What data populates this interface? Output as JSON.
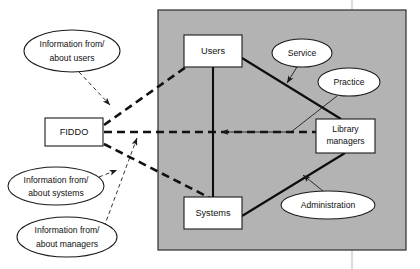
{
  "diagram": {
    "background_color": "#ffffff",
    "panel": {
      "label": "library-context-panel",
      "fill": "#b3b3b3",
      "stroke": "#3a3a3a",
      "x": 158,
      "y": 10,
      "width": 248,
      "height": 240
    },
    "boxes": [
      {
        "id": "fiddo",
        "label": "FIDDO",
        "lines": [
          "FIDDO"
        ],
        "x": 45,
        "y": 118,
        "width": 58,
        "height": 28
      },
      {
        "id": "users",
        "label": "Users",
        "lines": [
          "Users"
        ],
        "x": 184,
        "y": 35,
        "width": 58,
        "height": 32
      },
      {
        "id": "systems",
        "label": "Systems",
        "lines": [
          "Systems"
        ],
        "x": 184,
        "y": 197,
        "width": 58,
        "height": 32
      },
      {
        "id": "library-managers",
        "label": "Library managers",
        "lines": [
          "Library",
          "managers"
        ],
        "x": 316,
        "y": 119,
        "width": 59,
        "height": 34
      }
    ],
    "ellipses": [
      {
        "id": "information-from-about-users",
        "label": "Information from/ about users",
        "lines": [
          "Information from/",
          "about users"
        ],
        "cx": 72,
        "cy": 51,
        "rx": 48,
        "ry": 21
      },
      {
        "id": "information-from-about-systems",
        "label": "Information from/ about systems",
        "lines": [
          "Information from/",
          "about systems"
        ],
        "cx": 56,
        "cy": 186,
        "rx": 48,
        "ry": 19
      },
      {
        "id": "information-from-about-managers",
        "label": "Information from/ about managers",
        "lines": [
          "Information from/",
          "about managers"
        ],
        "cx": 67,
        "cy": 237,
        "rx": 50,
        "ry": 20
      },
      {
        "id": "service",
        "label": "Service",
        "lines": [
          "Service"
        ],
        "cx": 302,
        "cy": 53,
        "rx": 30,
        "ry": 14
      },
      {
        "id": "practice",
        "label": "Practice",
        "lines": [
          "Practice"
        ],
        "cx": 349,
        "cy": 82,
        "rx": 31,
        "ry": 14
      },
      {
        "id": "administration",
        "label": "Administration",
        "lines": [
          "Administration"
        ],
        "cx": 328,
        "cy": 205,
        "rx": 47,
        "ry": 14
      }
    ],
    "connections": [
      {
        "id": "fiddo-to-users",
        "style": "thick-dashed",
        "from": "fiddo",
        "to": "users"
      },
      {
        "id": "fiddo-to-library-managers",
        "style": "thick-dashed",
        "from": "fiddo",
        "to": "library-managers"
      },
      {
        "id": "fiddo-to-systems",
        "style": "thick-dashed",
        "from": "fiddo",
        "to": "systems"
      },
      {
        "id": "users-ellipse-to-fiddo-link",
        "style": "thin-dashed-arrow",
        "from": "information-from-about-users",
        "to": "fiddo-to-users"
      },
      {
        "id": "systems-ellipse-to-fiddo-link",
        "style": "thin-dashed-arrow",
        "from": "information-from-about-systems",
        "to": "fiddo-to-systems"
      },
      {
        "id": "managers-ellipse-to-fiddo-link",
        "style": "thin-dashed-arrow",
        "from": "information-from-about-managers",
        "to": "fiddo-to-library-managers"
      },
      {
        "id": "users-to-systems",
        "style": "thick-solid",
        "from": "users",
        "to": "systems"
      },
      {
        "id": "users-to-library-managers",
        "style": "thick-solid",
        "from": "users",
        "to": "library-managers"
      },
      {
        "id": "systems-to-library-managers",
        "style": "thick-solid",
        "from": "systems",
        "to": "library-managers"
      },
      {
        "id": "service-to-users-link",
        "style": "thin-solid-arrow",
        "from": "service",
        "to": "users-to-library-managers"
      },
      {
        "id": "practice-to-users-systems-link",
        "style": "thin-solid-arrow",
        "from": "practice",
        "to": "users-to-systems"
      },
      {
        "id": "administration-to-library-managers-link",
        "style": "thin-solid-arrow",
        "from": "administration",
        "to": "systems-to-library-managers"
      }
    ],
    "scan_artifact": {
      "id": "vertical-scan-line",
      "x": 352,
      "color": "#d8d8d8"
    }
  }
}
